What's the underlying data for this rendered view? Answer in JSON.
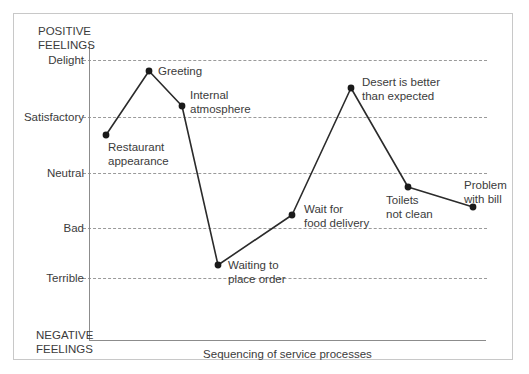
{
  "chart_data": {
    "type": "line",
    "title": "",
    "subtitle": "",
    "xlabel": "Sequencing of service processes",
    "ylabel": "",
    "grid": true,
    "legend": "none",
    "axis_top_label": "POSITIVE\nFEELINGS",
    "axis_bottom_label": "NEGATIVE\nFEELINGS",
    "y_tick_labels": [
      "Delight",
      "Satisfactory",
      "Neutral",
      "Bad",
      "Terrible"
    ],
    "y_scale_values": [
      5,
      4,
      3,
      2,
      1
    ],
    "ylim": [
      0,
      6
    ],
    "categories": [
      "Restaurant appearance",
      "Greeting",
      "Internal atmosphere",
      "Waiting to place order",
      "Wait for food delivery",
      "Desert is better than expected",
      "Toilets not clean",
      "Problem with bill"
    ],
    "values": [
      3.6,
      4.9,
      4.3,
      1.3,
      2.1,
      4.6,
      2.8,
      2.45
    ],
    "series": [
      {
        "name": "Customer feeling",
        "values": [
          3.6,
          4.9,
          4.3,
          1.3,
          2.1,
          4.6,
          2.8,
          2.45
        ]
      }
    ],
    "points": [
      {
        "label": "Restaurant\nappearance",
        "x": 106,
        "y": 135,
        "value": 3.6
      },
      {
        "label": "Greeting",
        "x": 149,
        "y": 71,
        "value": 4.9
      },
      {
        "label": "Internal\natmosphere",
        "x": 182,
        "y": 106,
        "value": 4.3
      },
      {
        "label": "Waiting to\nplace order",
        "x": 218,
        "y": 265,
        "value": 1.3
      },
      {
        "label": "Wait for\nfood delivery",
        "x": 292,
        "y": 215,
        "value": 2.1
      },
      {
        "label": "Desert is better\nthan expected",
        "x": 351,
        "y": 88,
        "value": 4.6
      },
      {
        "label": "Toilets\nnot clean",
        "x": 408,
        "y": 187,
        "value": 2.8
      },
      {
        "label": "Problem\nwith bill",
        "x": 473,
        "y": 207,
        "value": 2.45
      }
    ]
  },
  "axis": {
    "positive_feelings": "POSITIVE\nFEELINGS",
    "negative_feelings": "NEGATIVE\nFEELINGS",
    "caption": "Sequencing of service processes",
    "ticks": [
      {
        "label": "Delight",
        "y": 60
      },
      {
        "label": "Satisfactory",
        "y": 117
      },
      {
        "label": "Neutral",
        "y": 173
      },
      {
        "label": "Bad",
        "y": 228
      },
      {
        "label": "Terrible",
        "y": 278
      }
    ]
  },
  "point_labels": [
    {
      "text": "Restaurant\nappearance",
      "left": 108,
      "top": 141
    },
    {
      "text": "Greeting",
      "left": 158,
      "top": 65
    },
    {
      "text": "Internal\natmosphere",
      "left": 190,
      "top": 89
    },
    {
      "text": "Waiting to\nplace order",
      "left": 228,
      "top": 259
    },
    {
      "text": "Wait for\nfood delivery",
      "left": 304,
      "top": 203
    },
    {
      "text": "Desert is better\nthan expected",
      "left": 362,
      "top": 76
    },
    {
      "text": "Toilets\nnot clean",
      "left": 386,
      "top": 194
    },
    {
      "text": "Problem\nwith bill",
      "left": 464,
      "top": 179
    }
  ],
  "colors": {
    "line": "#2b2b2b",
    "marker": "#1a1a1a",
    "grid": "#9a9a9a",
    "axis": "#8c8c8c",
    "text": "#3b3b3b",
    "frame": "#c8c8c8",
    "background": "#ffffff"
  }
}
